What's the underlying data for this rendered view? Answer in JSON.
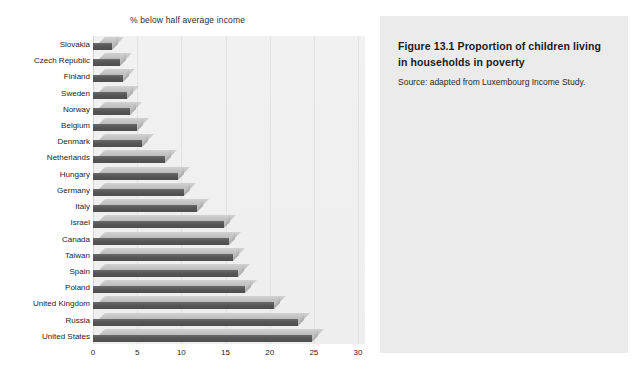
{
  "chart_data": {
    "type": "bar",
    "orientation": "horizontal",
    "title": "% below half average income",
    "xlabel": "",
    "ylabel": "",
    "xlim": [
      0,
      30
    ],
    "xticks": [
      0,
      5,
      10,
      15,
      20,
      25,
      30
    ],
    "grid": true,
    "legend": null,
    "categories": [
      "Slovakia",
      "Czech Republic",
      "Finland",
      "Sweden",
      "Norway",
      "Belgium",
      "Denmark",
      "Netherlands",
      "Hungary",
      "Germany",
      "Italy",
      "Israel",
      "Canada",
      "Taiwan",
      "Spain",
      "Poland",
      "United Kingdom",
      "Russia",
      "United States"
    ],
    "values": [
      2.2,
      3.0,
      3.4,
      3.8,
      4.2,
      5.0,
      5.5,
      8.2,
      9.6,
      10.3,
      11.8,
      14.8,
      15.4,
      15.9,
      16.4,
      17.2,
      20.5,
      23.2,
      24.8
    ]
  },
  "caption": {
    "title": "Figure 13.1  Proportion of children living in households in poverty",
    "source": "Source: adapted from Luxembourg Income Study."
  }
}
